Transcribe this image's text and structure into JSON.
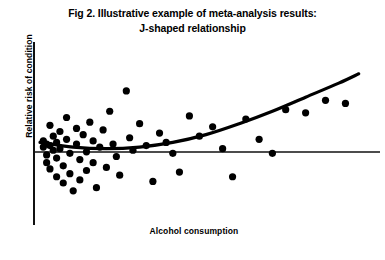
{
  "figure": {
    "title_line1": "Fig 2. Illustrative example of meta-analysis results:",
    "title_line2": "J-shaped relationship",
    "xlabel": "Alcohol consumption",
    "ylabel": "Relative risk of condition"
  },
  "chart_data": {
    "type": "scatter",
    "title": "Fig 2. Illustrative example of meta-analysis results: J-shaped relationship",
    "subtitle": "J-shaped relationship",
    "xlabel": "Alcohol consumption",
    "ylabel": "Relative risk of condition",
    "xlim": [
      0,
      100
    ],
    "ylim": [
      0,
      100
    ],
    "axis_ticks": "none",
    "grid": false,
    "legend": "none",
    "annotations": [],
    "reference_line": {
      "name": "null-effect-line",
      "orientation": "horizontal",
      "y": 50,
      "x_start": 0,
      "x_end": 100,
      "description": "Horizontal line of no effect (relative risk = 1)"
    },
    "series": [
      {
        "name": "study-estimates",
        "type": "scatter",
        "marker": "filled-circle",
        "color": "#000000",
        "points": [
          {
            "x": 1,
            "y": 52
          },
          {
            "x": 1,
            "y": 48
          },
          {
            "x": 2,
            "y": 50
          },
          {
            "x": 2,
            "y": 43
          },
          {
            "x": 2,
            "y": 38
          },
          {
            "x": 3,
            "y": 62
          },
          {
            "x": 3,
            "y": 49
          },
          {
            "x": 3,
            "y": 34
          },
          {
            "x": 4,
            "y": 55
          },
          {
            "x": 4,
            "y": 46
          },
          {
            "x": 5,
            "y": 51
          },
          {
            "x": 5,
            "y": 41
          },
          {
            "x": 5,
            "y": 29
          },
          {
            "x": 6,
            "y": 58
          },
          {
            "x": 6,
            "y": 47
          },
          {
            "x": 7,
            "y": 36
          },
          {
            "x": 7,
            "y": 25
          },
          {
            "x": 8,
            "y": 67
          },
          {
            "x": 8,
            "y": 53
          },
          {
            "x": 9,
            "y": 44
          },
          {
            "x": 9,
            "y": 31
          },
          {
            "x": 10,
            "y": 20
          },
          {
            "x": 11,
            "y": 60
          },
          {
            "x": 11,
            "y": 50
          },
          {
            "x": 12,
            "y": 40
          },
          {
            "x": 12,
            "y": 27
          },
          {
            "x": 13,
            "y": 56
          },
          {
            "x": 14,
            "y": 45
          },
          {
            "x": 14,
            "y": 33
          },
          {
            "x": 15,
            "y": 64
          },
          {
            "x": 16,
            "y": 52
          },
          {
            "x": 16,
            "y": 38
          },
          {
            "x": 17,
            "y": 22
          },
          {
            "x": 18,
            "y": 48
          },
          {
            "x": 19,
            "y": 59
          },
          {
            "x": 20,
            "y": 35
          },
          {
            "x": 21,
            "y": 71
          },
          {
            "x": 22,
            "y": 50
          },
          {
            "x": 23,
            "y": 42
          },
          {
            "x": 24,
            "y": 30
          },
          {
            "x": 26,
            "y": 84
          },
          {
            "x": 27,
            "y": 54
          },
          {
            "x": 28,
            "y": 46
          },
          {
            "x": 30,
            "y": 63
          },
          {
            "x": 32,
            "y": 49
          },
          {
            "x": 34,
            "y": 26
          },
          {
            "x": 36,
            "y": 57
          },
          {
            "x": 38,
            "y": 51
          },
          {
            "x": 40,
            "y": 44
          },
          {
            "x": 42,
            "y": 32
          },
          {
            "x": 45,
            "y": 68
          },
          {
            "x": 48,
            "y": 55
          },
          {
            "x": 52,
            "y": 61
          },
          {
            "x": 55,
            "y": 47
          },
          {
            "x": 58,
            "y": 29
          },
          {
            "x": 62,
            "y": 66
          },
          {
            "x": 66,
            "y": 53
          },
          {
            "x": 70,
            "y": 44
          },
          {
            "x": 74,
            "y": 72
          },
          {
            "x": 80,
            "y": 70
          },
          {
            "x": 86,
            "y": 78
          },
          {
            "x": 92,
            "y": 76
          }
        ]
      },
      {
        "name": "pooled-dose-response-curve",
        "type": "line",
        "shape": "J-shaped",
        "color": "#000000",
        "description": "Fitted curve dipping slightly below the null line at low consumption then rising steeply at high consumption",
        "points": [
          {
            "x": 0,
            "y": 51
          },
          {
            "x": 10,
            "y": 48
          },
          {
            "x": 20,
            "y": 47
          },
          {
            "x": 30,
            "y": 48
          },
          {
            "x": 40,
            "y": 51
          },
          {
            "x": 50,
            "y": 56
          },
          {
            "x": 60,
            "y": 63
          },
          {
            "x": 70,
            "y": 71
          },
          {
            "x": 80,
            "y": 80
          },
          {
            "x": 90,
            "y": 89
          },
          {
            "x": 96,
            "y": 95
          }
        ]
      }
    ]
  }
}
